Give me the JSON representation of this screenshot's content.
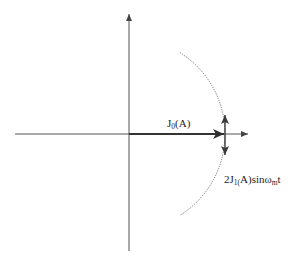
{
  "diagram": {
    "type": "phasor-diagram",
    "colors": {
      "background": "#ffffff",
      "axis": "#555555",
      "phasor": "#333333",
      "arc": "#666666",
      "text": "#1e1e1e"
    },
    "axes": {
      "horizontal": {
        "x1": 15,
        "y": 134,
        "x2": 248
      },
      "vertical": {
        "x": 129,
        "y1": 251,
        "y2": 14
      }
    },
    "carrier_phasor": {
      "label_main": "J",
      "label_sub": "0",
      "label_rest": "(A)",
      "from": [
        129,
        134
      ],
      "to": [
        224,
        134
      ]
    },
    "sideband_phasor": {
      "label_prefix": "2J",
      "label_sub": "1(",
      "label_mid": "A)sinω",
      "label_sub2": "m",
      "label_suffix": "t",
      "x": 225,
      "y_top": 115,
      "y_bottom": 155
    },
    "arc": {
      "center": [
        129,
        134
      ],
      "radius": 96,
      "start_angle_deg": -58,
      "end_angle_deg": 58,
      "style": "dotted"
    }
  }
}
